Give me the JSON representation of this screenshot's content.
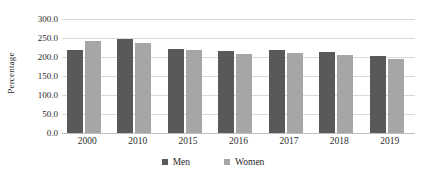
{
  "chart_data": {
    "type": "bar",
    "title": "",
    "subtitle": "",
    "xlabel": "",
    "ylabel": "Percentage",
    "categories": [
      "2000",
      "2010",
      "2015",
      "2016",
      "2017",
      "2018",
      "2019"
    ],
    "series": [
      {
        "name": "Men",
        "color": "#595959",
        "values": [
          218,
          248,
          221,
          217,
          219,
          213,
          202
        ]
      },
      {
        "name": "Women",
        "color": "#a6a6a6",
        "values": [
          242,
          237,
          218,
          207,
          211,
          205,
          196
        ]
      }
    ],
    "ylim": [
      0,
      300
    ],
    "ytick_values": [
      0,
      50,
      100,
      150,
      200,
      250,
      300
    ],
    "ytick_labels": [
      "0.0",
      "50.0",
      "100.0",
      "150.0",
      "200.0",
      "250.0",
      "300.0"
    ],
    "grid": true,
    "grid_color": "#d9d9d9",
    "legend_position": "bottom",
    "background_color": "#ffffff"
  },
  "axis": {
    "y_title": "Percentage"
  },
  "legend": {
    "entries": [
      {
        "label": "Men",
        "color": "#595959"
      },
      {
        "label": "Women",
        "color": "#a6a6a6"
      }
    ]
  }
}
